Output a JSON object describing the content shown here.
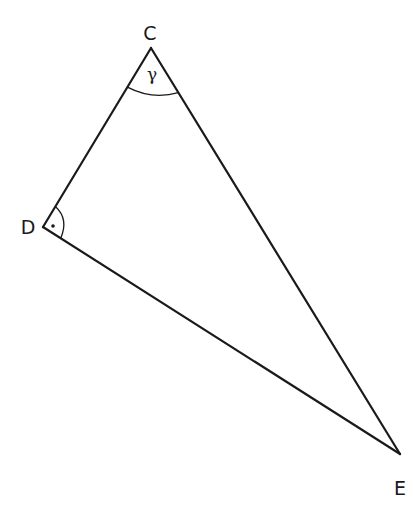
{
  "diagram": {
    "type": "right-triangle",
    "stroke_color": "#1a1a1a",
    "background": "#ffffff",
    "vertices": [
      {
        "name": "C",
        "x": 151,
        "y": 48,
        "label": "C",
        "label_x": 150,
        "label_y": 40
      },
      {
        "name": "D",
        "x": 43,
        "y": 227,
        "label": "D",
        "label_x": 28,
        "label_y": 234
      },
      {
        "name": "E",
        "x": 400,
        "y": 454,
        "label": "E",
        "label_x": 400,
        "label_y": 495
      }
    ],
    "sides": [
      {
        "from": "C",
        "to": "D"
      },
      {
        "from": "D",
        "to": "E"
      },
      {
        "from": "C",
        "to": "E"
      }
    ],
    "angles": [
      {
        "vertex": "C",
        "label": "γ",
        "kind": "arc"
      },
      {
        "vertex": "D",
        "label": "·",
        "kind": "right-angle-arc-dot"
      }
    ]
  }
}
